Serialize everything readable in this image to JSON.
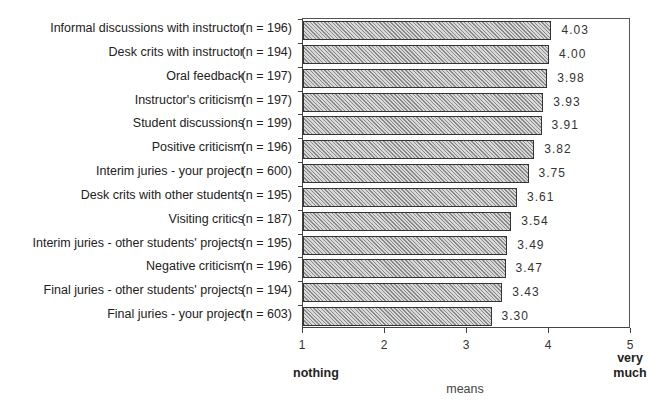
{
  "chart_data": {
    "type": "bar",
    "orientation": "horizontal",
    "title": "",
    "xlabel": "means",
    "ylabel": "",
    "xlim": [
      1,
      5
    ],
    "xticks": [
      1,
      2,
      3,
      4,
      5
    ],
    "x_anchor_labels": {
      "low": "nothing",
      "high": "very much"
    },
    "grid": false,
    "legend": null,
    "categories": [
      "Informal discussions with instructor",
      "Desk crits with instructor",
      "Oral feedback",
      "Instructor's criticism",
      "Student discussions",
      "Positive criticism",
      "Interim juries - your project",
      "Desk crits with other students",
      "Visiting critics",
      "Interim juries - other students' projects",
      "Negative criticism",
      "Final juries - other students' projects",
      "Final juries - your project"
    ],
    "n": [
      196,
      194,
      197,
      197,
      199,
      196,
      600,
      195,
      187,
      195,
      196,
      194,
      603
    ],
    "values": [
      4.03,
      4.0,
      3.98,
      3.93,
      3.91,
      3.82,
      3.75,
      3.61,
      3.54,
      3.49,
      3.47,
      3.43,
      3.3
    ],
    "value_labels": [
      "4.03",
      "4.00",
      "3.98",
      "3.93",
      "3.91",
      "3.82",
      "3.75",
      "3.61",
      "3.54",
      "3.49",
      "3.47",
      "3.43",
      "3.30"
    ]
  },
  "rows": [
    {
      "label": "Informal discussions with instructor",
      "n_text": "(n = 196)",
      "value": 4.03,
      "value_text": "4.03"
    },
    {
      "label": "Desk crits with instructor",
      "n_text": "(n = 194)",
      "value": 4.0,
      "value_text": "4.00"
    },
    {
      "label": "Oral feedback",
      "n_text": "(n = 197)",
      "value": 3.98,
      "value_text": "3.98"
    },
    {
      "label": "Instructor's criticism",
      "n_text": "(n = 197)",
      "value": 3.93,
      "value_text": "3.93"
    },
    {
      "label": "Student discussions",
      "n_text": "(n = 199)",
      "value": 3.91,
      "value_text": "3.91"
    },
    {
      "label": "Positive criticism",
      "n_text": "(n = 196)",
      "value": 3.82,
      "value_text": "3.82"
    },
    {
      "label": "Interim juries - your project",
      "n_text": "(n = 600)",
      "value": 3.75,
      "value_text": "3.75"
    },
    {
      "label": "Desk crits with other students",
      "n_text": "(n = 195)",
      "value": 3.61,
      "value_text": "3.61"
    },
    {
      "label": "Visiting critics",
      "n_text": "(n = 187)",
      "value": 3.54,
      "value_text": "3.54"
    },
    {
      "label": "Interim juries - other students' projects",
      "n_text": "(n = 195)",
      "value": 3.49,
      "value_text": "3.49"
    },
    {
      "label": "Negative criticism",
      "n_text": "(n = 196)",
      "value": 3.47,
      "value_text": "3.47"
    },
    {
      "label": "Final juries - other students' projects",
      "n_text": "(n = 194)",
      "value": 3.43,
      "value_text": "3.43"
    },
    {
      "label": "Final juries - your project",
      "n_text": "(n = 603)",
      "value": 3.3,
      "value_text": "3.30"
    }
  ],
  "axis": {
    "ticks": [
      "1",
      "2",
      "3",
      "4",
      "5"
    ],
    "low_anchor": "nothing",
    "high_anchor_line1": "very",
    "high_anchor_line2": "much",
    "xlabel": "means"
  }
}
